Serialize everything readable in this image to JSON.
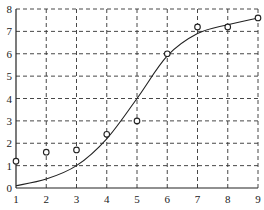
{
  "chart_data": {
    "type": "line",
    "title": "",
    "xlabel": "",
    "ylabel": "",
    "xlim": [
      1,
      9
    ],
    "ylim": [
      0,
      8
    ],
    "grid": true,
    "grid_style": "dashed",
    "x_ticks": [
      "1",
      "2",
      "3",
      "4",
      "5",
      "6",
      "7",
      "8",
      "9"
    ],
    "y_ticks": [
      "0",
      "1",
      "2",
      "3",
      "4",
      "5",
      "6",
      "7",
      "8"
    ],
    "x": [
      1,
      2,
      3,
      4,
      5,
      6,
      7,
      8,
      9
    ],
    "series": [
      {
        "name": "fitted curve",
        "style": "solid-line",
        "values": [
          0.1,
          0.4,
          1.0,
          2.2,
          4.0,
          5.9,
          6.9,
          7.3,
          7.6
        ]
      },
      {
        "name": "observed",
        "style": "circle-markers",
        "values": [
          1.2,
          1.6,
          1.7,
          2.4,
          3.0,
          6.0,
          7.2,
          7.2,
          7.6
        ]
      }
    ],
    "legend": null
  }
}
